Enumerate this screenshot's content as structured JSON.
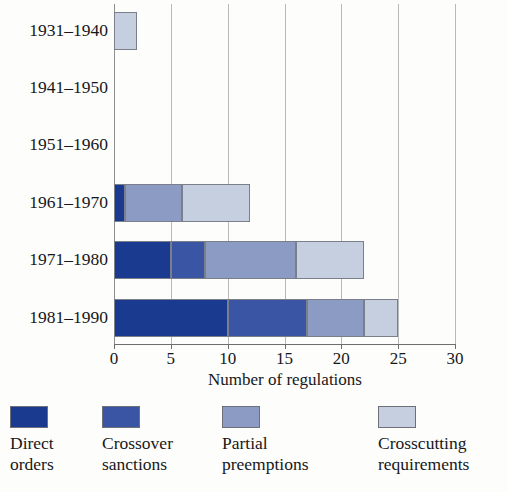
{
  "chart_data": {
    "type": "bar",
    "orientation": "horizontal",
    "stacked": true,
    "title": "",
    "xlabel": "Number of regulations",
    "ylabel": "",
    "xlim": [
      0,
      30
    ],
    "xticks": [
      0,
      5,
      10,
      15,
      20,
      25,
      30
    ],
    "xticklabels": [
      "0",
      "5",
      "10",
      "15",
      "20",
      "25",
      "30"
    ],
    "grid": "vertical",
    "legend_position": "bottom",
    "categories": [
      "1931–1940",
      "1941–1950",
      "1951–1960",
      "1961–1970",
      "1971–1980",
      "1981–1990"
    ],
    "series": [
      {
        "name": "Direct orders",
        "color": "#1a3a8f",
        "values": [
          0,
          0,
          0,
          1,
          5,
          10
        ]
      },
      {
        "name": "Crossover sanctions",
        "color": "#3b55a5",
        "values": [
          0,
          0,
          0,
          0,
          3,
          7
        ]
      },
      {
        "name": "Partial preemptions",
        "color": "#8c9bc4",
        "values": [
          0,
          0,
          0,
          5,
          8,
          5
        ]
      },
      {
        "name": "Crosscutting requirements",
        "color": "#c5cfdf",
        "values": [
          2,
          0,
          0,
          6,
          6,
          3
        ]
      }
    ],
    "totals": [
      2,
      0,
      0,
      12,
      22,
      25
    ]
  },
  "axis": {
    "x_title": "Number of regulations",
    "ticks": [
      "0",
      "5",
      "10",
      "15",
      "20",
      "25",
      "30"
    ]
  },
  "categories": {
    "labels": [
      "1931–1940",
      "1941–1950",
      "1951–1960",
      "1961–1970",
      "1971–1980",
      "1981–1990"
    ]
  },
  "legend": {
    "items": [
      {
        "line1": "Direct",
        "line2": "orders",
        "color": "#1a3a8f"
      },
      {
        "line1": "Crossover",
        "line2": "sanctions",
        "color": "#3b55a5"
      },
      {
        "line1": "Partial",
        "line2": "preemptions",
        "color": "#8c9bc4"
      },
      {
        "line1": "Crosscutting",
        "line2": "requirements",
        "color": "#c5cfdf"
      }
    ]
  },
  "colors": {
    "direct_orders": "#1a3a8f",
    "crossover_sanctions": "#3b55a5",
    "partial_preemptions": "#8c9bc4",
    "crosscutting_requirements": "#c5cfdf",
    "gridline": "#b9b9b9",
    "axis": "#6e6e6e",
    "background": "#fdfdfb"
  }
}
